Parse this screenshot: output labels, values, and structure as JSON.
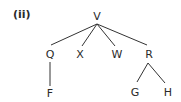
{
  "title": "(ii)",
  "tree": {
    "root": "V",
    "nodes": {
      "V": {
        "label": "V",
        "x": 97,
        "y": 16
      },
      "Q": {
        "label": "Q",
        "x": 50,
        "y": 54
      },
      "X": {
        "label": "X",
        "x": 79,
        "y": 54
      },
      "W": {
        "label": "W",
        "x": 117,
        "y": 54
      },
      "R": {
        "label": "R",
        "x": 149,
        "y": 54
      },
      "F": {
        "label": "F",
        "x": 50,
        "y": 93
      },
      "G": {
        "label": "G",
        "x": 135,
        "y": 92
      },
      "H": {
        "label": "H",
        "x": 168,
        "y": 92
      }
    },
    "edges": [
      [
        "V",
        "Q"
      ],
      [
        "V",
        "X"
      ],
      [
        "V",
        "W"
      ],
      [
        "V",
        "R"
      ],
      [
        "Q",
        "F"
      ],
      [
        "R",
        "G"
      ],
      [
        "R",
        "H"
      ]
    ]
  },
  "line_color": "#333333"
}
